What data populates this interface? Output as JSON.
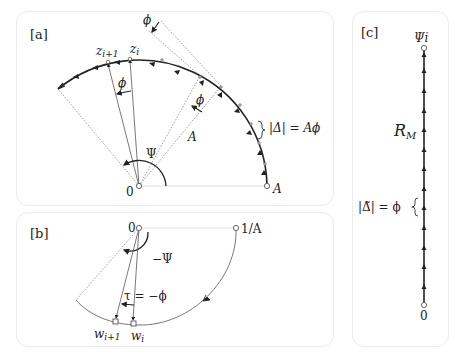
{
  "panels": {
    "a": {
      "tag": "[a]",
      "labels": {
        "z_i1_base": "z",
        "z_i1_sub": "i+1",
        "z_i_base": "z",
        "z_i_sub": "i",
        "phi_top": "ϕ",
        "phi_mid": "ϕ",
        "phi_right": "ϕ",
        "A_radius": "A",
        "Psi": "Ψ",
        "origin": "0",
        "A_point": "A",
        "delta": "|Δ| = Aϕ"
      }
    },
    "b": {
      "tag": "[b]",
      "labels": {
        "origin": "0",
        "inv_A": "1/A",
        "neg_Psi": "−Ψ",
        "tau": "τ = −ϕ",
        "w_i1_base": "w",
        "w_i1_sub": "i+1",
        "w_i_base": "w",
        "w_i_sub": "i"
      }
    },
    "c": {
      "tag": "[c]",
      "labels": {
        "top": "Ψi",
        "RM_base": "R",
        "RM_sub": "M",
        "delta_tilde": "|Δ̃| = ϕ",
        "bottom": "0"
      }
    }
  },
  "colors": {
    "stroke": "#222222",
    "thin": "#555555",
    "dotted": "#888888",
    "panel_border": "#ececec"
  }
}
